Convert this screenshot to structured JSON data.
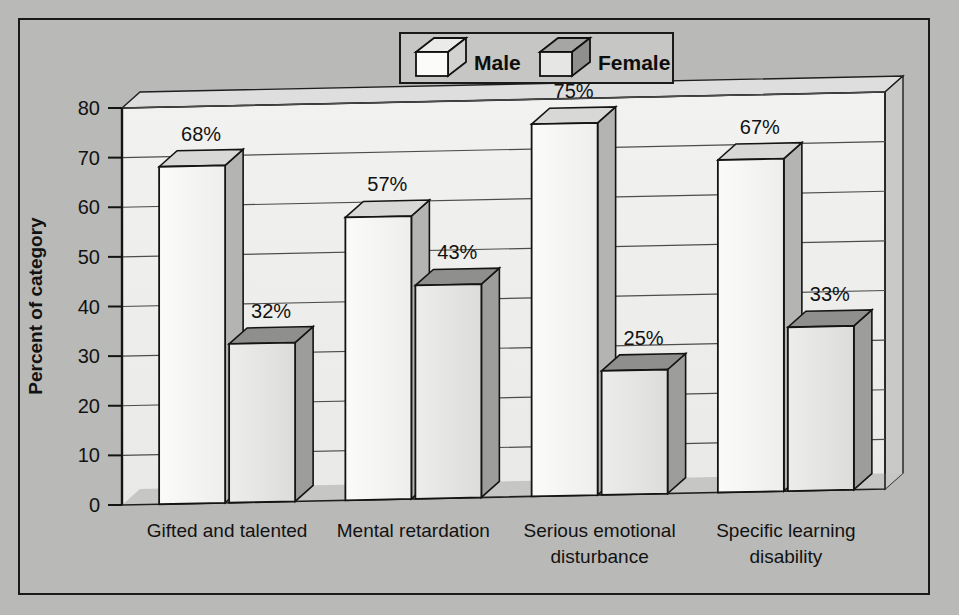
{
  "chart_data": {
    "type": "bar",
    "title": "",
    "xlabel": "",
    "ylabel": "Percent of category",
    "ylim": [
      0,
      80
    ],
    "ytick_step": 10,
    "yticks": [
      "0",
      "10",
      "20",
      "30",
      "40",
      "50",
      "60",
      "70",
      "80"
    ],
    "grid": true,
    "legend_position": "top-center",
    "value_suffix": "%",
    "categories": [
      "Gifted and talented",
      "Mental retardation",
      "Serious emotional disturbance",
      "Specific learning disability"
    ],
    "category_lines": [
      [
        "Gifted and talented"
      ],
      [
        "Mental retardation"
      ],
      [
        "Serious emotional",
        "disturbance"
      ],
      [
        "Specific learning",
        "disability"
      ]
    ],
    "series": [
      {
        "name": "Male",
        "values": [
          68,
          57,
          75,
          67
        ],
        "labels": [
          "68%",
          "57%",
          "75%",
          "67%"
        ],
        "face_color": "#f3f3f1",
        "top_color": "#d8d8d6",
        "side_color": "#b4b4b2"
      },
      {
        "name": "Female",
        "values": [
          32,
          43,
          25,
          33
        ],
        "labels": [
          "32%",
          "43%",
          "25%",
          "33%"
        ],
        "face_color": "#e2e2e0",
        "top_color": "#8f8f8d",
        "side_color": "#9d9d9b"
      }
    ]
  },
  "legend": {
    "items": [
      {
        "label": "Male",
        "icon": "cube-icon"
      },
      {
        "label": "Female",
        "icon": "cube-icon"
      }
    ]
  },
  "colors": {
    "background": "#b9b9b7",
    "frame_border": "#1a1a1a",
    "plot_floor": "#c3c3c1",
    "plot_wall": "#efefed",
    "gridline": "#4d4d4d",
    "text": "#121212"
  }
}
